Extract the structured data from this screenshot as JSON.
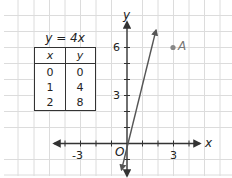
{
  "figure": {
    "table": {
      "title": "y = 4x",
      "headers": [
        "x",
        "y"
      ],
      "rows": [
        [
          "0",
          "0"
        ],
        [
          "1",
          "4"
        ],
        [
          "2",
          "8"
        ]
      ]
    },
    "axes": {
      "x_label": "x",
      "y_label": "y",
      "origin_label": "O",
      "x_tick_labels": [
        "-3",
        "3"
      ],
      "y_tick_labels": [
        "3",
        "6"
      ]
    },
    "line": {
      "equation": "y = 4x",
      "color": "#555555"
    },
    "point": {
      "label": "A",
      "x": 3,
      "y": 6,
      "color": "#888888"
    },
    "colors": {
      "grid": "#dcdcdc",
      "axis": "#333333",
      "text": "#222222"
    }
  }
}
